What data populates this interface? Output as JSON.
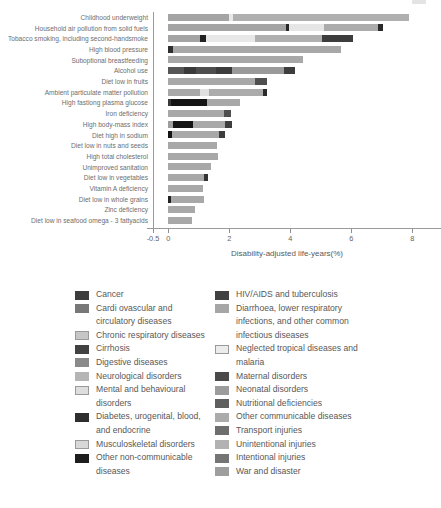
{
  "chart_data": {
    "type": "bar",
    "orientation": "horizontal",
    "xlabel": "Disability-adjusted life-years(%)",
    "x_ticks": [
      "-0.5",
      "0",
      "2",
      "4",
      "6",
      "8"
    ],
    "x_tick_values": [
      -0.5,
      0,
      2,
      4,
      6,
      8
    ],
    "xlim": [
      -0.5,
      8.75
    ],
    "grid": false,
    "legend_position": "bottom-two-columns",
    "rows": [
      {
        "label": "Childhood underweight",
        "total": 7.88,
        "segments": [
          {
            "v": 1.98,
            "c": "#a4a4a4"
          },
          {
            "v": 0.15,
            "c": "#e8e8e8"
          },
          {
            "v": 5.75,
            "c": "#b0b0b0"
          }
        ]
      },
      {
        "label": "Household air pollution from solid fuels",
        "total": 7.05,
        "segments": [
          {
            "v": 3.87,
            "c": "#a4a4a4"
          },
          {
            "v": 0.08,
            "c": "#2a2a2a"
          },
          {
            "v": 1.15,
            "c": "#e6e6e6"
          },
          {
            "v": 1.77,
            "c": "#ababab"
          },
          {
            "v": 0.18,
            "c": "#2a2a2a"
          }
        ]
      },
      {
        "label": "Tobacco smoking, including second-handsmoke",
        "total": 6.07,
        "segments": [
          {
            "v": 1.05,
            "c": "#a4a4a4"
          },
          {
            "v": 0.2,
            "c": "#222222"
          },
          {
            "v": 1.61,
            "c": "#e8e8e8"
          },
          {
            "v": 2.19,
            "c": "#b0b0b0"
          },
          {
            "v": 1.02,
            "c": "#3d3d3d"
          }
        ]
      },
      {
        "label": "High blood pressure",
        "total": 5.68,
        "segments": [
          {
            "v": 0.15,
            "c": "#2e2e2e"
          },
          {
            "v": 5.53,
            "c": "#a8a8a8"
          }
        ]
      },
      {
        "label": "Suboptional breastfeeding",
        "total": 4.42,
        "segments": [
          {
            "v": 4.42,
            "c": "#a8a8a8"
          }
        ]
      },
      {
        "label": "Alcohol use",
        "total": 4.16,
        "segments": [
          {
            "v": 0.5,
            "c": "#565656"
          },
          {
            "v": 0.41,
            "c": "#3a3a3a"
          },
          {
            "v": 0.66,
            "c": "#4e4e4e"
          },
          {
            "v": 0.52,
            "c": "#3c3c3c"
          },
          {
            "v": 1.72,
            "c": "#9a9a9a"
          },
          {
            "v": 0.35,
            "c": "#3d3d3d"
          }
        ]
      },
      {
        "label": "Diet low in fruits",
        "total": 3.25,
        "segments": [
          {
            "v": 2.85,
            "c": "#a8a8a8"
          },
          {
            "v": 0.4,
            "c": "#4f4f4f"
          }
        ]
      },
      {
        "label": "Ambient particulate matter pollution",
        "total": 3.25,
        "segments": [
          {
            "v": 1.05,
            "c": "#a8a8a8"
          },
          {
            "v": 0.27,
            "c": "#e0e0e0"
          },
          {
            "v": 1.8,
            "c": "#ababab"
          },
          {
            "v": 0.13,
            "c": "#2b2b2b"
          }
        ]
      },
      {
        "label": "High fastiong plasma glucose",
        "total": 2.36,
        "segments": [
          {
            "v": 0.09,
            "c": "#3a3a3a"
          },
          {
            "v": 1.18,
            "c": "#141414"
          },
          {
            "v": 1.09,
            "c": "#a8a8a8"
          }
        ]
      },
      {
        "label": "Iron deficiency",
        "total": 2.06,
        "segments": [
          {
            "v": 1.84,
            "c": "#a8a8a8"
          },
          {
            "v": 0.22,
            "c": "#4f4f4f"
          }
        ]
      },
      {
        "label": "High body-mass index",
        "total": 2.1,
        "segments": [
          {
            "v": 0.17,
            "c": "#9e9e9e"
          },
          {
            "v": 0.65,
            "c": "#141414"
          },
          {
            "v": 1.05,
            "c": "#a8a8a8"
          },
          {
            "v": 0.23,
            "c": "#3d3d3d"
          }
        ]
      },
      {
        "label": "Diet high in sodium",
        "total": 1.87,
        "segments": [
          {
            "v": 0.11,
            "c": "#141414"
          },
          {
            "v": 1.57,
            "c": "#a8a8a8"
          },
          {
            "v": 0.19,
            "c": "#3d3d3d"
          }
        ]
      },
      {
        "label": "Diet low in nuts and seeds",
        "total": 1.61,
        "segments": [
          {
            "v": 1.61,
            "c": "#a8a8a8"
          }
        ]
      },
      {
        "label": "High total cholesterol",
        "total": 1.63,
        "segments": [
          {
            "v": 1.63,
            "c": "#a8a8a8"
          }
        ]
      },
      {
        "label": "Unimproved sanitation",
        "total": 1.41,
        "segments": [
          {
            "v": 1.41,
            "c": "#a8a8a8"
          }
        ]
      },
      {
        "label": "Diet low in vegetables",
        "total": 1.3,
        "segments": [
          {
            "v": 1.17,
            "c": "#a8a8a8"
          },
          {
            "v": 0.13,
            "c": "#333333"
          }
        ]
      },
      {
        "label": "Vitamin A deficiency",
        "total": 1.15,
        "segments": [
          {
            "v": 1.15,
            "c": "#a8a8a8"
          }
        ]
      },
      {
        "label": "Diet low in whole grains",
        "total": 1.18,
        "segments": [
          {
            "v": 0.09,
            "c": "#222222"
          },
          {
            "v": 1.09,
            "c": "#a8a8a8"
          }
        ]
      },
      {
        "label": "Zinc deficiency",
        "total": 0.88,
        "segments": [
          {
            "v": 0.88,
            "c": "#a8a8a8"
          }
        ]
      },
      {
        "label": "Diet low in seafood omega - 3 fattyacids",
        "total": 0.77,
        "segments": [
          {
            "v": 0.77,
            "c": "#a8a8a8"
          }
        ]
      }
    ],
    "legend": {
      "left": [
        {
          "label": "Cancer",
          "color": "#3d3d3d"
        },
        {
          "label": "Cardi ovascular and circulatory diseases",
          "color": "#787878"
        },
        {
          "label": "Chronic respiratory diseases",
          "color": "#c6c6c6"
        },
        {
          "label": "Cirrhosis",
          "color": "#424242"
        },
        {
          "label": "Digestive diseases",
          "color": "#8a8a8a"
        },
        {
          "label": "Neurological disorders",
          "color": "#b5b5b5"
        },
        {
          "label": "Mental and behavioural disorders",
          "color": "#dedede"
        },
        {
          "label": "Diabetes, urogenital, blood, and endocrine",
          "color": "#2e2e2e"
        },
        {
          "label": "Musculoskeletal disorders",
          "color": "#d8d8d8"
        },
        {
          "label": "Other non-communicable diseases",
          "color": "#1e1e1e"
        }
      ],
      "right": [
        {
          "label": "HIV/AIDS and tuberculosis",
          "color": "#404040"
        },
        {
          "label": "Diarrhoea, lower respiratory infections, and other common infectious diseases",
          "color": "#a6a6a6"
        },
        {
          "label": "Neglected tropical diseases and malaria",
          "color": "#ececec"
        },
        {
          "label": "Maternal disorders",
          "color": "#4a4a4a"
        },
        {
          "label": "Neonatal disorders",
          "color": "#9c9c9c"
        },
        {
          "label": "Nutritional deficiencies",
          "color": "#5f5f5f"
        },
        {
          "label": "Other communicable diseases",
          "color": "#ababab"
        },
        {
          "label": "Transport injuries",
          "color": "#6e6e6e"
        },
        {
          "label": "Unintentional injuries",
          "color": "#b2b2b2"
        },
        {
          "label": "Intentional injuries",
          "color": "#757575"
        },
        {
          "label": "War and disaster",
          "color": "#9e9e9e"
        }
      ]
    }
  }
}
